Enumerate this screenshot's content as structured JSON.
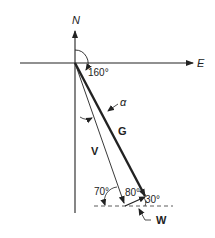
{
  "diagram": {
    "type": "vector-navigation-diagram",
    "axes": {
      "north_label": "N",
      "east_label": "E"
    },
    "vectors": [
      {
        "id": "G",
        "label": "G",
        "style": "thick",
        "description": "ground vector"
      },
      {
        "id": "V",
        "label": "V",
        "style": "thin",
        "description": "velocity vector"
      },
      {
        "id": "W",
        "label": "W",
        "style": "short",
        "description": "wind vector"
      }
    ],
    "angles": {
      "heading": "160°",
      "alpha": "α",
      "angle_70": "70°",
      "angle_80": "80°",
      "angle_30": "30°"
    },
    "colors": {
      "line": "#222222",
      "background": "#ffffff"
    }
  }
}
